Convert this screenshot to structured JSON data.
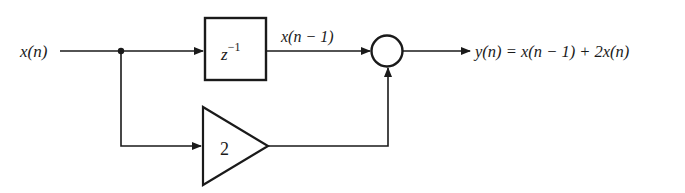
{
  "diagram": {
    "input_label": "x(n)",
    "delay_block": {
      "label_base": "z",
      "label_exp": "−1"
    },
    "delay_output_label": "x(n − 1)",
    "gain_block": {
      "label": "2"
    },
    "adder": {
      "label": ""
    },
    "output_label": "y(n) = x(n − 1) + 2x(n)"
  },
  "colors": {
    "stroke": "#1a1a1a",
    "background": "#ffffff"
  }
}
